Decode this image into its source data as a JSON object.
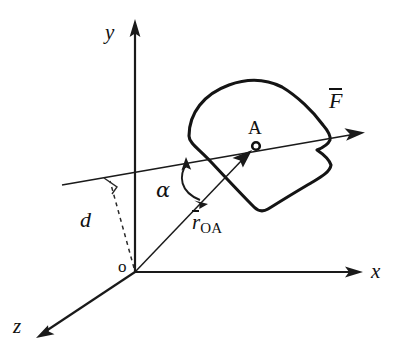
{
  "figure": {
    "type": "mechanics-vector-diagram",
    "canvas": {
      "width": 398,
      "height": 359,
      "background": "#ffffff"
    },
    "ink_color": "#141414"
  },
  "axes": [
    {
      "name": "y-axis",
      "label": "y",
      "origin": [
        135,
        272
      ],
      "tip": [
        135,
        22
      ],
      "label_pos": [
        109,
        27
      ]
    },
    {
      "name": "x-axis",
      "label": "x",
      "origin": [
        135,
        272
      ],
      "tip": [
        362,
        272
      ],
      "label_pos": [
        372,
        262
      ]
    },
    {
      "name": "z-axis",
      "label": "z",
      "origin": [
        135,
        272
      ],
      "tip": [
        36,
        338
      ],
      "label_pos": [
        14,
        317
      ]
    }
  ],
  "origin": {
    "name": "origin-point",
    "label": "o",
    "pos": [
      135,
      272
    ],
    "label_pos": [
      120,
      258
    ]
  },
  "rigid_body": {
    "name": "rigid-body-outline",
    "description": "closed irregular lamina outline with concave notch on right side",
    "path": "M 189 135 C 189 112, 205 93, 230 84 C 252 76, 268 79, 281 86 C 296 94, 312 110, 323 124 C 329 131, 331 136, 330 140 C 328 144, 322 147, 318 150 C 324 154, 329 159, 331 165 C 330 172, 322 176, 312 182 C 298 190, 281 200, 268 208 C 263 211, 259 211, 255 207 C 246 198, 228 179, 213 163 C 200 150, 189 142, 189 135 Z"
  },
  "force": {
    "name": "force-vector-F",
    "label_symbol": "F",
    "overbar": true,
    "line_start": [
      62,
      185
    ],
    "line_end": [
      362,
      133
    ],
    "arrow_tip": [
      362,
      133
    ],
    "label_pos": [
      330,
      92
    ]
  },
  "position_vector": {
    "name": "position-vector-rOA",
    "label_symbol": "r",
    "subscript": "OA",
    "overbar": true,
    "line_start": [
      135,
      272
    ],
    "arrow_tip": [
      252,
      150
    ],
    "label_pos": [
      193,
      214
    ]
  },
  "point_A": {
    "name": "point-A",
    "label": "A",
    "pos": [
      256,
      146
    ],
    "radius": 4,
    "label_pos": [
      247,
      119
    ]
  },
  "angle": {
    "name": "angle-alpha",
    "label": "α",
    "between": [
      "force-vector-F",
      "position-vector-rOA"
    ],
    "vertex_region": [
      190,
      180
    ],
    "arc_start": [
      186,
      160
    ],
    "arc_end": [
      207,
      203
    ],
    "double_headed": true,
    "label_pos": [
      156,
      181
    ]
  },
  "perpendicular_distance": {
    "name": "perpendicular-distance-d",
    "label": "d",
    "from": [
      135,
      272
    ],
    "to": [
      111,
      182
    ],
    "dashed": true,
    "right_angle_marker": true,
    "label_pos": [
      82,
      212
    ]
  }
}
